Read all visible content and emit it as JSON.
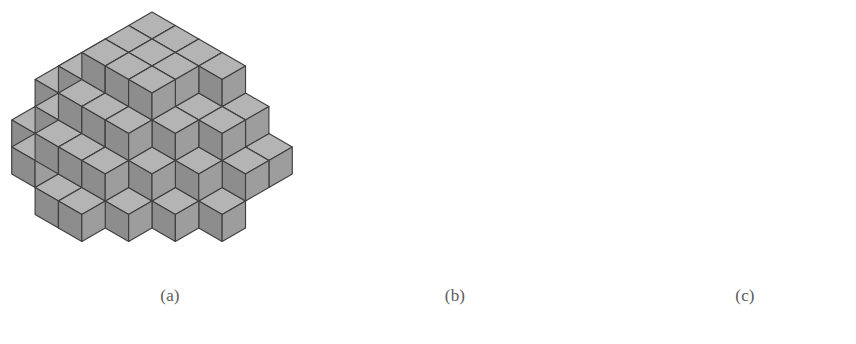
{
  "figure": {
    "background": "#ffffff",
    "stroke_color": "#3f3f3f",
    "line_color": "#6e6e6e",
    "caption_color": "#5a5a5a",
    "cube_size": 27,
    "faces": {
      "top": "#b4b4b4",
      "left": "#8d8d8d",
      "right": "#9d9d9d"
    }
  },
  "panels": [
    {
      "id": "panel-a",
      "caption": "(a)",
      "caption_x": 170,
      "caption_y": 295,
      "origin_x": 152,
      "origin_y": 120,
      "description": "large lozenge tiling / plane partition of stacked cubes",
      "cubes": [
        {
          "x": 0,
          "y": 2,
          "z": 3
        },
        {
          "x": 0,
          "y": 1,
          "z": 3
        },
        {
          "x": 1,
          "y": 2,
          "z": 3
        },
        {
          "x": 1,
          "y": 1,
          "z": 3
        },
        {
          "x": 2,
          "y": 2,
          "z": 3
        },
        {
          "x": 2,
          "y": 1,
          "z": 3
        },
        {
          "x": 0,
          "y": 0,
          "z": 3
        },
        {
          "x": 1,
          "y": 0,
          "z": 3
        },
        {
          "x": 2,
          "y": 0,
          "z": 3
        },
        {
          "x": 3,
          "y": 0,
          "z": 3
        },
        {
          "x": 0,
          "y": 3,
          "z": 2
        },
        {
          "x": 1,
          "y": 3,
          "z": 2
        },
        {
          "x": 2,
          "y": 3,
          "z": 2
        },
        {
          "x": 3,
          "y": 1,
          "z": 2
        },
        {
          "x": 3,
          "y": 2,
          "z": 2
        },
        {
          "x": 4,
          "y": 0,
          "z": 2
        },
        {
          "x": 4,
          "y": 1,
          "z": 2
        },
        {
          "x": -1,
          "y": 1,
          "z": 2
        },
        {
          "x": -1,
          "y": 2,
          "z": 2
        },
        {
          "x": -1,
          "y": 3,
          "z": 1
        },
        {
          "x": 0,
          "y": 4,
          "z": 1
        },
        {
          "x": 1,
          "y": 4,
          "z": 1
        },
        {
          "x": 2,
          "y": 4,
          "z": 1
        },
        {
          "x": 3,
          "y": 3,
          "z": 1
        },
        {
          "x": 4,
          "y": 2,
          "z": 1
        },
        {
          "x": 5,
          "y": 1,
          "z": 1
        },
        {
          "x": 5,
          "y": 0,
          "z": 1
        },
        {
          "x": -2,
          "y": 2,
          "z": 1
        },
        {
          "x": -2,
          "y": 1,
          "z": 1
        },
        {
          "x": 3,
          "y": 4,
          "z": 0
        },
        {
          "x": 2,
          "y": 5,
          "z": 0
        },
        {
          "x": 1,
          "y": 5,
          "z": 0
        },
        {
          "x": -1,
          "y": 4,
          "z": 0
        },
        {
          "x": -2,
          "y": 3,
          "z": 0
        },
        {
          "x": 5,
          "y": 2,
          "z": 0
        },
        {
          "x": 4,
          "y": 3,
          "z": 0
        }
      ]
    },
    {
      "id": "panel-b",
      "caption": "(b)",
      "caption_x": 455,
      "caption_y": 295,
      "origin_x": 414,
      "origin_y": 104,
      "description": "three-cube staircase with open boundary edge path",
      "cubes": [
        {
          "x": 0,
          "y": 0,
          "z": 0
        },
        {
          "x": 0,
          "y": 1,
          "z": 0
        },
        {
          "x": 1,
          "y": 2,
          "z": 0
        }
      ]
    },
    {
      "id": "panel-c",
      "caption": "(c)",
      "caption_x": 745,
      "caption_y": 295,
      "origin_x": 726,
      "origin_y": 116,
      "description": "medium cluster of cubes with detached lozenge and open edge path",
      "cubes": [
        {
          "x": -1,
          "y": 0,
          "z": 2
        },
        {
          "x": -1,
          "y": 1,
          "z": 2
        },
        {
          "x": -1,
          "y": 2,
          "z": 1
        },
        {
          "x": 0,
          "y": 0,
          "z": 1
        },
        {
          "x": 0,
          "y": 1,
          "z": 1
        },
        {
          "x": 1,
          "y": 0,
          "z": 1
        },
        {
          "x": 0,
          "y": 2,
          "z": 0
        },
        {
          "x": 1,
          "y": 1,
          "z": 0
        },
        {
          "x": 2,
          "y": 0,
          "z": 0
        },
        {
          "x": -1,
          "y": 3,
          "z": 0
        },
        {
          "x": 1,
          "y": 2,
          "z": -1
        }
      ]
    }
  ],
  "captions": {
    "a": "(a)",
    "b": "(b)",
    "c": "(c)"
  }
}
